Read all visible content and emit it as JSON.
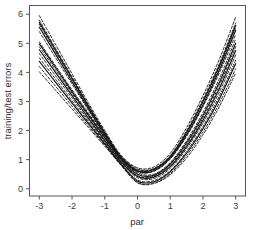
{
  "chart_data": {
    "type": "line",
    "title": "",
    "subtitle": "",
    "xlabel": "par",
    "ylabel": "training/test errors",
    "xlim": [
      -3.3,
      3.3
    ],
    "ylim": [
      -0.25,
      6.3
    ],
    "xticks": [
      -3,
      -2,
      -1,
      0,
      1,
      2,
      3
    ],
    "xticklabels": [
      "-3",
      "-2",
      "-1",
      "0",
      "1",
      "2",
      "3"
    ],
    "yticks": [
      0,
      1,
      2,
      3,
      4,
      5,
      6
    ],
    "yticklabels": [
      "0",
      "1",
      "2",
      "3",
      "4",
      "5",
      "6"
    ],
    "grid": false,
    "legend": null,
    "frame": "box",
    "x": [
      -3,
      -2.5,
      -2,
      -1.5,
      -1,
      -0.5,
      0,
      0.5,
      1,
      1.5,
      2,
      2.5,
      3
    ],
    "series": [
      {
        "name": "test-curve-1",
        "style": "dashed",
        "color": "#1a1a1a",
        "values": [
          5.95,
          4.95,
          3.95,
          2.95,
          2.0,
          1.15,
          0.72,
          0.75,
          1.22,
          2.1,
          3.2,
          4.45,
          5.9
        ]
      },
      {
        "name": "test-curve-2",
        "style": "dashed",
        "color": "#1a1a1a",
        "values": [
          5.8,
          4.82,
          3.85,
          2.88,
          1.95,
          1.12,
          0.68,
          0.7,
          1.15,
          2.0,
          3.08,
          4.3,
          5.7
        ]
      },
      {
        "name": "test-curve-3",
        "style": "dashed",
        "color": "#1a1a1a",
        "values": [
          5.65,
          4.7,
          3.75,
          2.8,
          1.9,
          1.1,
          0.66,
          0.68,
          1.1,
          1.92,
          2.98,
          4.18,
          5.55
        ]
      },
      {
        "name": "train-curve-1",
        "style": "solid",
        "color": "#111111",
        "values": [
          5.72,
          4.76,
          3.8,
          2.84,
          1.92,
          1.08,
          0.62,
          0.66,
          1.1,
          1.94,
          3.0,
          4.22,
          5.62
        ]
      },
      {
        "name": "train-curve-2",
        "style": "solid",
        "color": "#111111",
        "values": [
          5.55,
          4.62,
          3.68,
          2.75,
          1.85,
          1.05,
          0.6,
          0.62,
          1.05,
          1.85,
          2.88,
          4.08,
          5.45
        ]
      },
      {
        "name": "test-curve-4",
        "style": "dashed",
        "color": "#1a1a1a",
        "values": [
          5.4,
          4.5,
          3.6,
          2.7,
          1.82,
          1.02,
          0.58,
          0.6,
          1.02,
          1.8,
          2.82,
          3.98,
          5.3
        ]
      },
      {
        "name": "test-curve-5",
        "style": "dashed",
        "color": "#1a1a1a",
        "values": [
          5.05,
          4.22,
          3.4,
          2.6,
          1.8,
          1.05,
          0.55,
          0.5,
          0.9,
          1.65,
          2.62,
          3.78,
          5.15
        ]
      },
      {
        "name": "train-curve-3",
        "style": "solid",
        "color": "#111111",
        "values": [
          4.98,
          4.16,
          3.34,
          2.54,
          1.76,
          1.0,
          0.5,
          0.46,
          0.85,
          1.58,
          2.52,
          3.65,
          5.0
        ]
      },
      {
        "name": "test-curve-6",
        "style": "dashed",
        "color": "#1a1a1a",
        "values": [
          4.88,
          4.08,
          3.28,
          2.5,
          1.72,
          0.96,
          0.45,
          0.42,
          0.8,
          1.52,
          2.44,
          3.55,
          4.88
        ]
      },
      {
        "name": "train-curve-4",
        "style": "solid",
        "color": "#111111",
        "values": [
          4.78,
          3.99,
          3.2,
          2.43,
          1.66,
          0.92,
          0.42,
          0.4,
          0.76,
          1.45,
          2.35,
          3.44,
          4.75
        ]
      },
      {
        "name": "test-curve-7",
        "style": "dashed",
        "color": "#1a1a1a",
        "values": [
          4.65,
          3.88,
          3.12,
          2.36,
          1.62,
          0.88,
          0.38,
          0.35,
          0.7,
          1.38,
          2.26,
          3.32,
          4.6
        ]
      },
      {
        "name": "test-curve-8",
        "style": "dashed",
        "color": "#1a1a1a",
        "values": [
          4.5,
          3.76,
          3.02,
          2.3,
          1.58,
          0.86,
          0.3,
          0.28,
          0.62,
          1.28,
          2.14,
          3.18,
          4.42
        ]
      },
      {
        "name": "train-curve-5",
        "style": "solid",
        "color": "#111111",
        "values": [
          4.38,
          3.66,
          2.94,
          2.24,
          1.54,
          0.84,
          0.26,
          0.24,
          0.58,
          1.22,
          2.06,
          3.08,
          4.3
        ]
      },
      {
        "name": "test-curve-9",
        "style": "dashed",
        "color": "#1a1a1a",
        "values": [
          4.2,
          3.52,
          2.84,
          2.16,
          1.5,
          0.82,
          0.22,
          0.2,
          0.52,
          1.14,
          1.95,
          2.94,
          4.12
        ]
      },
      {
        "name": "test-curve-10",
        "style": "dashed",
        "color": "#1a1a1a",
        "values": [
          4.02,
          3.38,
          2.74,
          2.1,
          1.46,
          0.8,
          0.2,
          0.18,
          0.48,
          1.06,
          1.85,
          2.82,
          3.98
        ]
      }
    ]
  },
  "figure": {
    "background_color": "#ffffff",
    "axis_color": "#555555",
    "tick_label_color": "#3a3a3a"
  }
}
